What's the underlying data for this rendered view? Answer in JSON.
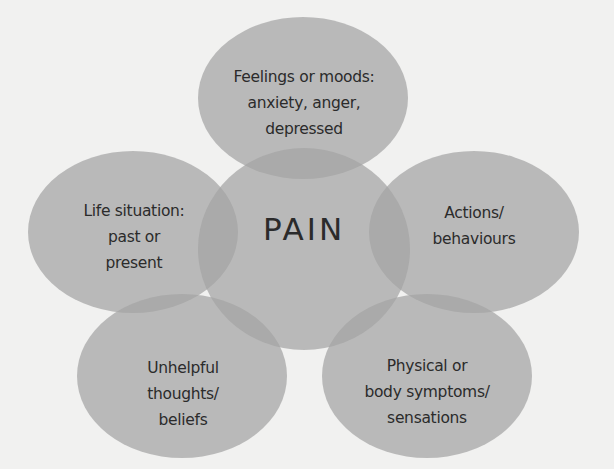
{
  "diagram": {
    "center": {
      "label": "PAIN"
    },
    "nodes": [
      {
        "id": "feelings",
        "lines": [
          "Feelings or moods:",
          "anxiety, anger,",
          "depressed"
        ]
      },
      {
        "id": "life-situation",
        "lines": [
          "Life situation:",
          "past or",
          "present"
        ]
      },
      {
        "id": "actions",
        "lines": [
          "Actions/",
          "behaviours"
        ]
      },
      {
        "id": "thoughts",
        "lines": [
          "Unhelpful",
          "thoughts/",
          "beliefs"
        ]
      },
      {
        "id": "physical",
        "lines": [
          "Physical or",
          "body symptoms/",
          "sensations"
        ]
      }
    ],
    "colors": {
      "background": "#f1f1f0",
      "shape_fill": "#a3a3a3",
      "text": "#2b2b2b"
    }
  }
}
